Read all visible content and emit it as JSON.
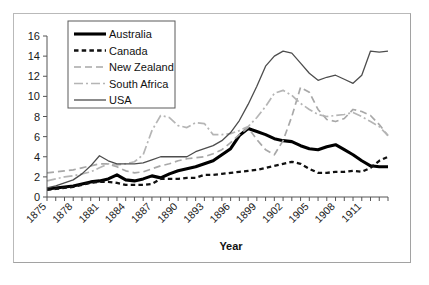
{
  "chart_data": {
    "type": "line",
    "title": "",
    "xlabel": "Year",
    "ylabel": "",
    "xlim": [
      1875,
      1914
    ],
    "ylim": [
      0,
      16
    ],
    "ytick_step": 2,
    "grid": false,
    "legend_position": "top-left",
    "yticks": [
      "0",
      "2",
      "4",
      "6",
      "8",
      "10",
      "12",
      "14",
      "16"
    ],
    "xticks": [
      "1875",
      "1878",
      "1881",
      "1884",
      "1887",
      "1890",
      "1893",
      "1896",
      "1899",
      "1902",
      "1905",
      "1908",
      "1911"
    ],
    "x": [
      1875,
      1876,
      1877,
      1878,
      1879,
      1880,
      1881,
      1882,
      1883,
      1884,
      1885,
      1886,
      1887,
      1888,
      1889,
      1890,
      1891,
      1892,
      1893,
      1894,
      1895,
      1896,
      1897,
      1898,
      1899,
      1900,
      1901,
      1902,
      1903,
      1904,
      1905,
      1906,
      1907,
      1908,
      1909,
      1910,
      1911,
      1912,
      1913,
      1914
    ],
    "series": [
      {
        "name": "Australia",
        "style": "solid-thick",
        "color": "#000000",
        "width": 3.1,
        "dash": "",
        "values": [
          0.8,
          0.9,
          1.0,
          1.1,
          1.3,
          1.5,
          1.6,
          1.8,
          2.2,
          1.7,
          1.6,
          1.8,
          2.1,
          1.9,
          2.3,
          2.6,
          2.8,
          3.0,
          3.3,
          3.6,
          4.2,
          4.8,
          6.1,
          6.8,
          6.5,
          6.2,
          5.8,
          5.6,
          5.5,
          5.1,
          4.8,
          4.7,
          5.0,
          5.2,
          4.7,
          4.2,
          3.6,
          3.1,
          3.0,
          3.0
        ]
      },
      {
        "name": "Canada",
        "style": "dashed-thick",
        "color": "#111111",
        "width": 2.3,
        "dash": "4.5,3.2",
        "values": [
          0.7,
          0.8,
          0.9,
          1.0,
          1.2,
          1.4,
          1.5,
          1.5,
          1.4,
          1.2,
          1.2,
          1.2,
          1.3,
          1.8,
          1.8,
          1.8,
          1.9,
          1.9,
          2.2,
          2.2,
          2.3,
          2.4,
          2.5,
          2.6,
          2.7,
          2.9,
          3.1,
          3.3,
          3.5,
          3.3,
          2.8,
          2.4,
          2.4,
          2.5,
          2.5,
          2.6,
          2.5,
          2.9,
          3.6,
          4.0
        ]
      },
      {
        "name": "New Zealand",
        "style": "dashed-light",
        "color": "#a8a8a8",
        "width": 1.7,
        "dash": "7,4",
        "values": [
          2.4,
          2.5,
          2.6,
          2.7,
          2.9,
          3.1,
          3.3,
          3.3,
          3.0,
          2.6,
          2.4,
          2.5,
          2.8,
          3.1,
          3.3,
          3.6,
          3.8,
          3.9,
          4.0,
          4.3,
          4.7,
          5.4,
          6.2,
          6.9,
          5.7,
          4.7,
          4.2,
          5.6,
          8.0,
          10.9,
          10.4,
          8.7,
          7.7,
          7.5,
          7.8,
          8.7,
          8.5,
          8.1,
          7.2,
          6.1
        ]
      },
      {
        "name": "South Africa",
        "style": "dash-dot-light",
        "color": "#b5b5b5",
        "width": 1.7,
        "dash": "9,3,2,3",
        "values": [
          1.6,
          1.8,
          2.0,
          2.1,
          2.3,
          2.5,
          2.9,
          3.3,
          3.2,
          3.3,
          3.5,
          4.2,
          6.6,
          8.1,
          7.9,
          7.1,
          6.9,
          7.4,
          7.3,
          6.2,
          6.2,
          6.3,
          6.6,
          7.0,
          7.9,
          9.0,
          10.3,
          10.6,
          10.1,
          9.3,
          8.7,
          8.2,
          8.0,
          8.1,
          8.2,
          8.4,
          8.0,
          7.5,
          7.0,
          6.1
        ]
      },
      {
        "name": "USA",
        "style": "solid-thin",
        "color": "#4d4d4d",
        "width": 1.3,
        "dash": "",
        "values": [
          0.9,
          1.1,
          1.4,
          1.7,
          2.3,
          3.1,
          4.1,
          3.6,
          3.3,
          3.3,
          3.3,
          3.4,
          3.7,
          4.0,
          4.0,
          4.0,
          4.0,
          4.5,
          4.8,
          5.1,
          5.6,
          6.4,
          7.6,
          9.2,
          11.0,
          13.0,
          14.0,
          14.5,
          14.3,
          13.3,
          12.3,
          11.6,
          11.9,
          12.1,
          11.7,
          11.3,
          12.1,
          14.5,
          14.4,
          14.5
        ]
      }
    ]
  },
  "legend": {
    "entries": [
      {
        "label": "Australia"
      },
      {
        "label": "Canada"
      },
      {
        "label": "New Zealand"
      },
      {
        "label": "South Africa"
      },
      {
        "label": "USA"
      }
    ]
  }
}
